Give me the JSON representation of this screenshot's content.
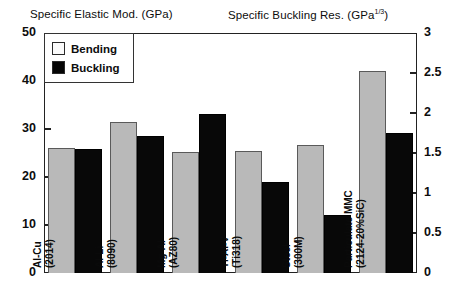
{
  "titles": {
    "left": "Specific Elastic Mod. (GPa)",
    "right_main": "Specific Buckling Res. (GPa",
    "right_exp": "1/3",
    "right_tail": ")"
  },
  "legend": {
    "bending_label": "Bending",
    "buckling_label": "Buckling",
    "bending_color": "#fbfbfb",
    "buckling_color": "#050505"
  },
  "axes": {
    "left_ticks": [
      "50",
      "40",
      "30",
      "20",
      "10",
      "0"
    ],
    "right_ticks": [
      "3",
      "2.5",
      "2",
      "1.5",
      "1",
      "0.5",
      "0"
    ]
  },
  "chart_data": {
    "type": "bar",
    "xlabel": "",
    "ylabel": "Specific Elastic Mod. (GPa)",
    "y2label": "Specific Buckling Res. (GPa^1/3)",
    "ylim": [
      0,
      50
    ],
    "y2lim": [
      0,
      3
    ],
    "grid": false,
    "legend_position": "top-left",
    "categories": [
      "Al-Cu (2014)",
      "Al-Li (8090)",
      "Mg-Al (AZ80)",
      "Ti-Al-V (Ti318)",
      "Steel (300M)",
      "Particulate MMC (2124-20%SiC)"
    ],
    "category_lines": [
      [
        "Al-Cu",
        "(2014)"
      ],
      [
        "Al-Li",
        "(8090)"
      ],
      [
        "Mg-Al",
        "(AZ80)"
      ],
      [
        "Ti-Al-V",
        "(Ti318)"
      ],
      [
        "Steel",
        "(300M)"
      ],
      [
        "Particulate MMC",
        "(2124-20%SiC)"
      ]
    ],
    "series": [
      {
        "name": "Bending",
        "axis": "left",
        "units": "GPa",
        "values": [
          26.0,
          31.5,
          25.2,
          25.5,
          26.6,
          42.0
        ]
      },
      {
        "name": "Buckling",
        "axis": "right",
        "units": "GPa^1/3",
        "values_right_axis": [
          1.55,
          1.71,
          2.0,
          1.14,
          0.73,
          1.75
        ],
        "values": [
          25.8,
          28.5,
          33.2,
          19.0,
          12.1,
          29.1
        ]
      }
    ]
  }
}
